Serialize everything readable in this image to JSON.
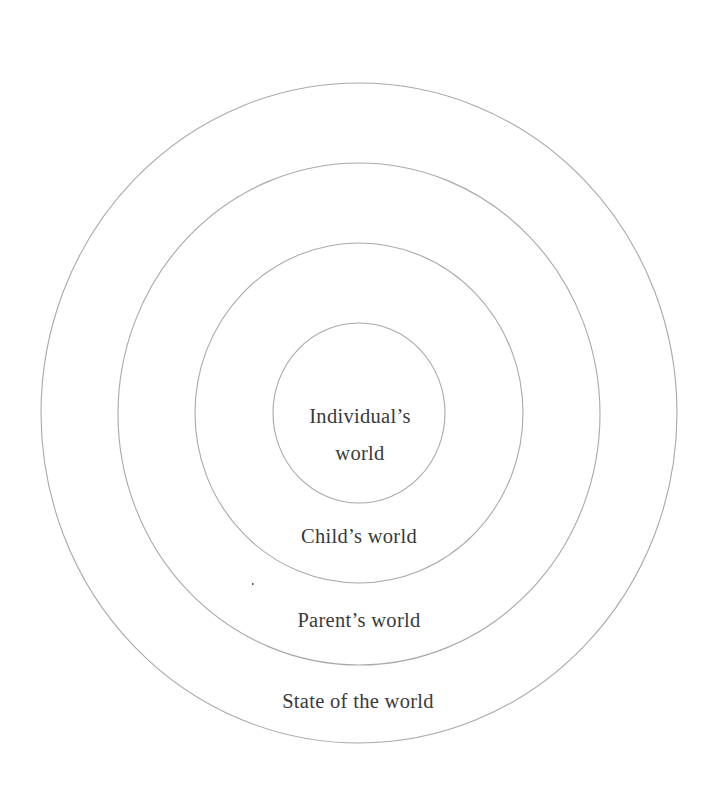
{
  "diagram": {
    "type": "concentric-circles",
    "center": {
      "x": 359,
      "y": 413
    },
    "stroke_color": "#a9a9a9",
    "text_color": "#3a3a3a",
    "rings": [
      {
        "name": "state-of-the-world",
        "rx": 318,
        "ry": 330,
        "label": "State of the world",
        "label_y": 708
      },
      {
        "name": "parents-world",
        "rx": 241,
        "ry": 251,
        "label": "Parent’s world",
        "label_y": 627
      },
      {
        "name": "childs-world",
        "rx": 164,
        "ry": 170,
        "label": "Child’s world",
        "label_y": 543
      },
      {
        "name": "individuals-world",
        "rx": 86,
        "ry": 90,
        "label_line1": "Individual’s",
        "label_line2": "world",
        "label_y1": 423,
        "label_y2": 460
      }
    ]
  }
}
